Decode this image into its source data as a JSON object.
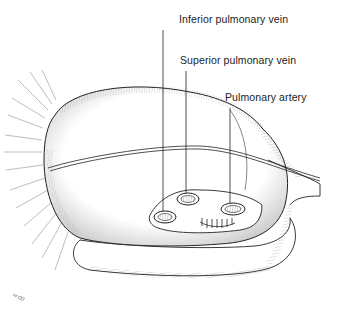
{
  "figure": {
    "labels": [
      {
        "id": "inferior-pulmonary-vein",
        "text": "Inferior pulmonary vein"
      },
      {
        "id": "superior-pulmonary-vein",
        "text": "Superior pulmonary vein"
      },
      {
        "id": "pulmonary-artery",
        "text": "Pulmonary artery"
      }
    ],
    "signature": "≈ꝏ",
    "colors": {
      "ink": "#222222",
      "background": "#ffffff",
      "shading": "#555555"
    }
  }
}
